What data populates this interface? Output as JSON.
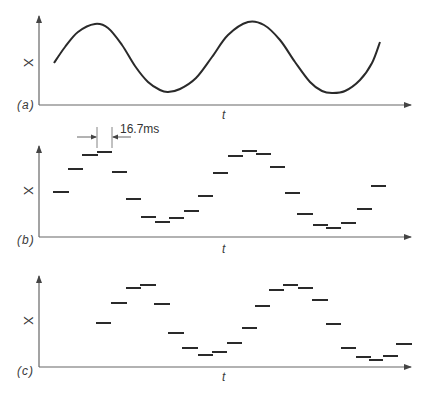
{
  "figure": {
    "panels": [
      {
        "id": "a",
        "label": "(a)",
        "y_axis_label": "X",
        "x_axis_label": "t",
        "type": "continuous-signal",
        "curve_points": [
          [
            54,
            63
          ],
          [
            65,
            47
          ],
          [
            78,
            32
          ],
          [
            95,
            24
          ],
          [
            108,
            28
          ],
          [
            122,
            45
          ],
          [
            135,
            66
          ],
          [
            148,
            82
          ],
          [
            160,
            90
          ],
          [
            168,
            92
          ],
          [
            180,
            89
          ],
          [
            196,
            78
          ],
          [
            212,
            57
          ],
          [
            228,
            35
          ],
          [
            248,
            22
          ],
          [
            264,
            25
          ],
          [
            280,
            40
          ],
          [
            295,
            62
          ],
          [
            310,
            82
          ],
          [
            322,
            91
          ],
          [
            332,
            93
          ],
          [
            345,
            91
          ],
          [
            360,
            80
          ],
          [
            372,
            63
          ],
          [
            380,
            42
          ]
        ]
      },
      {
        "id": "b",
        "label": "(b)",
        "y_axis_label": "X",
        "x_axis_label": "t",
        "type": "sampled-hold",
        "segments": [
          [
            53,
            69,
            192
          ],
          [
            68,
            83,
            169
          ],
          [
            82,
            98,
            155
          ],
          [
            97,
            112,
            152
          ],
          [
            112,
            127,
            172
          ],
          [
            126,
            141,
            199
          ],
          [
            141,
            156,
            217
          ],
          [
            155,
            170,
            222
          ],
          [
            169,
            184,
            218
          ],
          [
            184,
            199,
            211
          ],
          [
            198,
            213,
            196
          ],
          [
            213,
            228,
            173
          ],
          [
            228,
            243,
            156
          ],
          [
            242,
            257,
            151
          ],
          [
            256,
            271,
            154
          ],
          [
            270,
            285,
            167
          ],
          [
            285,
            300,
            193
          ],
          [
            297,
            313,
            214
          ],
          [
            313,
            328,
            225
          ],
          [
            326,
            341,
            228
          ],
          [
            341,
            356,
            223
          ],
          [
            357,
            372,
            209
          ],
          [
            371,
            386,
            186
          ]
        ]
      },
      {
        "id": "c",
        "label": "(c)",
        "y_axis_label": "X",
        "x_axis_label": "t",
        "type": "delayed-sampled-hold",
        "segments": [
          [
            96,
            111,
            323
          ],
          [
            111,
            127,
            303
          ],
          [
            126,
            141,
            288
          ],
          [
            140,
            156,
            285
          ],
          [
            154,
            170,
            304
          ],
          [
            168,
            184,
            333
          ],
          [
            182,
            198,
            348
          ],
          [
            198,
            213,
            355
          ],
          [
            212,
            227,
            352
          ],
          [
            227,
            242,
            343
          ],
          [
            242,
            257,
            328
          ],
          [
            255,
            270,
            306
          ],
          [
            269,
            284,
            290
          ],
          [
            283,
            298,
            285
          ],
          [
            298,
            313,
            288
          ],
          [
            312,
            328,
            300
          ],
          [
            326,
            341,
            324
          ],
          [
            341,
            356,
            348
          ],
          [
            356,
            371,
            357
          ],
          [
            369,
            383,
            360
          ],
          [
            383,
            398,
            356
          ],
          [
            396,
            412,
            344
          ]
        ]
      }
    ],
    "annotation": {
      "text": "16.7ms",
      "meaning": "sample interval"
    },
    "colors": {
      "line": "#2a2a2a",
      "axis": "#555555",
      "text": "#3a3a3a"
    }
  }
}
